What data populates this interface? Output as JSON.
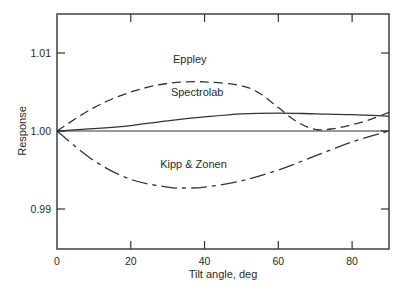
{
  "chart_data": {
    "type": "line",
    "title": "",
    "xlabel": "Tilt angle, deg",
    "ylabel": "Response",
    "xlim": [
      0,
      90
    ],
    "ylim": [
      0.985,
      1.0155
    ],
    "xticks": [
      0,
      20,
      40,
      60,
      80
    ],
    "xtick_labels": [
      "0",
      "20",
      "40",
      "60",
      "80"
    ],
    "yticks": [
      0.99,
      1.0,
      1.01
    ],
    "ytick_labels": [
      "0.99",
      "1.00",
      "1.01"
    ],
    "grid": false,
    "legend": "inline labels",
    "reference_line": 1.0,
    "series": [
      {
        "name": "Eppley",
        "style": "dashed",
        "x": [
          0,
          10,
          20,
          30,
          40,
          50,
          55,
          60,
          65,
          70,
          75,
          80,
          85,
          90
        ],
        "y": [
          1.0,
          1.003,
          1.005,
          1.0061,
          1.0063,
          1.0058,
          1.0048,
          1.003,
          1.0012,
          1.0002,
          1.0003,
          1.0008,
          1.0015,
          1.0024
        ]
      },
      {
        "name": "Spectrolab",
        "style": "solid",
        "x": [
          0,
          10,
          20,
          30,
          40,
          50,
          60,
          70,
          80,
          90
        ],
        "y": [
          1.0,
          1.0003,
          1.0007,
          1.0013,
          1.0018,
          1.0022,
          1.0023,
          1.0022,
          1.0021,
          1.0019
        ]
      },
      {
        "name": "Kipp & Zonen",
        "style": "dash-dot",
        "x": [
          0,
          10,
          20,
          30,
          35,
          40,
          50,
          60,
          70,
          80,
          90
        ],
        "y": [
          1.0,
          0.9962,
          0.9938,
          0.9928,
          0.9927,
          0.9928,
          0.9936,
          0.995,
          0.9968,
          0.9986,
          1.0
        ]
      }
    ],
    "annotations": [
      {
        "text": "Eppley",
        "x": 36,
        "y": 1.0087
      },
      {
        "text": "Spectrolab",
        "x": 38,
        "y": 1.0045
      },
      {
        "text": "Kipp & Zonen",
        "x": 37,
        "y": 0.9952
      }
    ]
  },
  "labels": {
    "xlabel": "Tilt angle, deg",
    "ylabel": "Response",
    "series": [
      "Eppley",
      "Spectrolab",
      "Kipp & Zonen"
    ]
  }
}
